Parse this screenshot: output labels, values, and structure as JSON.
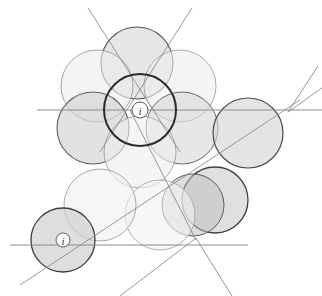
{
  "figure": {
    "canvas": {
      "width": 322,
      "height": 296,
      "background": "#ffffff"
    },
    "palette": {
      "fill_light": "#f2f2f2",
      "fill_medium": "#dcdcdc",
      "fill_dark": "#c9c9c9",
      "stroke_light": "#9a9a9a",
      "stroke_medium": "#6d6d6d",
      "stroke_dark": "#2b2b2b",
      "line_color": "#8c8c8c",
      "marker_fill": "#ffffff",
      "marker_stroke": "#4a4a4a",
      "marker_text": "#3a3a3a"
    },
    "circles": [
      {
        "name": "circle-top",
        "cx": 137,
        "cy": 63,
        "r": 36,
        "fill": "#d2d2d2",
        "opacity": 0.55,
        "stroke": "#555555",
        "stroke_width": 1.1
      },
      {
        "name": "circle-upper-left",
        "cx": 97,
        "cy": 86,
        "r": 36,
        "fill": "#ececec",
        "opacity": 0.6,
        "stroke": "#9a9a9a",
        "stroke_width": 0.9
      },
      {
        "name": "circle-upper-right",
        "cx": 180,
        "cy": 86,
        "r": 36,
        "fill": "#efefef",
        "opacity": 0.6,
        "stroke": "#a4a4a4",
        "stroke_width": 0.9
      },
      {
        "name": "circle-left",
        "cx": 93,
        "cy": 128,
        "r": 36,
        "fill": "#d0d0d0",
        "opacity": 0.62,
        "stroke": "#5f5f5f",
        "stroke_width": 1.1
      },
      {
        "name": "circle-right",
        "cx": 182,
        "cy": 128,
        "r": 36,
        "fill": "#d6d6d6",
        "opacity": 0.58,
        "stroke": "#6a6a6a",
        "stroke_width": 1.0
      },
      {
        "name": "circle-lower-center",
        "cx": 140,
        "cy": 152,
        "r": 36,
        "fill": "#efefef",
        "opacity": 0.6,
        "stroke": "#9e9e9e",
        "stroke_width": 0.9
      },
      {
        "name": "circle-center-bold",
        "cx": 140,
        "cy": 110,
        "r": 36,
        "fill": "none",
        "opacity": 1.0,
        "stroke": "#2b2b2b",
        "stroke_width": 2.0
      },
      {
        "name": "circle-far-right",
        "cx": 248,
        "cy": 133,
        "r": 35,
        "fill": "#d4d4d4",
        "opacity": 0.62,
        "stroke": "#4a4a4a",
        "stroke_width": 1.2
      },
      {
        "name": "circle-lower-right",
        "cx": 215,
        "cy": 200,
        "r": 33,
        "fill": "#cfcfcf",
        "opacity": 0.65,
        "stroke": "#3f3f3f",
        "stroke_width": 1.3
      },
      {
        "name": "circle-lower-right-overlap",
        "cx": 193,
        "cy": 205,
        "r": 31,
        "fill": "#bdbdbd",
        "opacity": 0.5,
        "stroke": "#5a5a5a",
        "stroke_width": 1.0
      },
      {
        "name": "circle-bottom-mid",
        "cx": 160,
        "cy": 215,
        "r": 35,
        "fill": "#f1f1f1",
        "opacity": 0.6,
        "stroke": "#a8a8a8",
        "stroke_width": 0.9
      },
      {
        "name": "circle-bottom-left-big",
        "cx": 100,
        "cy": 205,
        "r": 36,
        "fill": "#f0f0f0",
        "opacity": 0.6,
        "stroke": "#a0a0a0",
        "stroke_width": 0.9
      },
      {
        "name": "circle-bottom-left",
        "cx": 63,
        "cy": 240,
        "r": 32,
        "fill": "#cfcfcf",
        "opacity": 0.68,
        "stroke": "#3f3f3f",
        "stroke_width": 1.3
      }
    ],
    "lines": [
      {
        "name": "line-horizontal-upper",
        "x1": 37,
        "y1": 110,
        "x2": 322,
        "y2": 110,
        "stroke": "#8c8c8c",
        "stroke_width": 1.0
      },
      {
        "name": "line-horizontal-lower",
        "x1": 10,
        "y1": 245,
        "x2": 248,
        "y2": 245,
        "stroke": "#8c8c8c",
        "stroke_width": 1.0
      },
      {
        "name": "line-diagonal-top-left",
        "x1": 88,
        "y1": 8,
        "x2": 180,
        "y2": 152,
        "stroke": "#8c8c8c",
        "stroke_width": 0.9
      },
      {
        "name": "line-diagonal-top-right",
        "x1": 192,
        "y1": 8,
        "x2": 100,
        "y2": 152,
        "stroke": "#8c8c8c",
        "stroke_width": 0.9
      },
      {
        "name": "line-diagonal-right-upper",
        "x1": 288,
        "y1": 112,
        "x2": 318,
        "y2": 66,
        "stroke": "#8c8c8c",
        "stroke_width": 0.9
      },
      {
        "name": "line-diagonal-right-lower",
        "x1": 288,
        "y1": 112,
        "x2": 322,
        "y2": 88,
        "stroke": "#8c8c8c",
        "stroke_width": 0.9
      },
      {
        "name": "line-diagonal-long-sw-ne",
        "x1": 20,
        "y1": 285,
        "x2": 300,
        "y2": 100,
        "stroke": "#8c8c8c",
        "stroke_width": 0.9
      },
      {
        "name": "line-diagonal-bottom-left",
        "x1": 196,
        "y1": 238,
        "x2": 120,
        "y2": 296,
        "stroke": "#8c8c8c",
        "stroke_width": 0.9
      },
      {
        "name": "line-diagonal-bottom-right",
        "x1": 196,
        "y1": 238,
        "x2": 232,
        "y2": 296,
        "stroke": "#8c8c8c",
        "stroke_width": 0.9
      },
      {
        "name": "line-diagonal-center-down",
        "x1": 130,
        "y1": 110,
        "x2": 196,
        "y2": 240,
        "stroke": "#8c8c8c",
        "stroke_width": 0.9
      }
    ],
    "markers": [
      {
        "name": "marker-center",
        "cx": 140,
        "cy": 110,
        "r": 8,
        "label": "i"
      },
      {
        "name": "marker-bottom-left",
        "cx": 63,
        "cy": 240,
        "r": 7,
        "label": "i"
      }
    ]
  },
  "chart_data": {
    "type": "scatter",
    "xlabel": "",
    "ylabel": "",
    "xlim": [
      0,
      322
    ],
    "ylim": [
      0,
      296
    ],
    "grid": false,
    "legend": "none",
    "series": [
      {
        "name": "circles",
        "points": [
          {
            "label": "circle-top",
            "x": 137,
            "y": 63,
            "r": 36
          },
          {
            "label": "circle-upper-left",
            "x": 97,
            "y": 86,
            "r": 36
          },
          {
            "label": "circle-upper-right",
            "x": 180,
            "y": 86,
            "r": 36
          },
          {
            "label": "circle-left",
            "x": 93,
            "y": 128,
            "r": 36
          },
          {
            "label": "circle-right",
            "x": 182,
            "y": 128,
            "r": 36
          },
          {
            "label": "circle-lower-center",
            "x": 140,
            "y": 152,
            "r": 36
          },
          {
            "label": "circle-center-bold",
            "x": 140,
            "y": 110,
            "r": 36
          },
          {
            "label": "circle-far-right",
            "x": 248,
            "y": 133,
            "r": 35
          },
          {
            "label": "circle-lower-right",
            "x": 215,
            "y": 200,
            "r": 33
          },
          {
            "label": "circle-lower-right-overlap",
            "x": 193,
            "y": 205,
            "r": 31
          },
          {
            "label": "circle-bottom-mid",
            "x": 160,
            "y": 215,
            "r": 35
          },
          {
            "label": "circle-bottom-left-big",
            "x": 100,
            "y": 205,
            "r": 36
          },
          {
            "label": "circle-bottom-left",
            "x": 63,
            "y": 240,
            "r": 32
          }
        ]
      },
      {
        "name": "markers",
        "points": [
          {
            "label": "i",
            "x": 140,
            "y": 110,
            "r": 8
          },
          {
            "label": "i",
            "x": 63,
            "y": 240,
            "r": 7
          }
        ]
      }
    ],
    "annotations": [
      {
        "text": "i",
        "x": 140,
        "y": 110
      },
      {
        "text": "i",
        "x": 63,
        "y": 240
      }
    ]
  }
}
